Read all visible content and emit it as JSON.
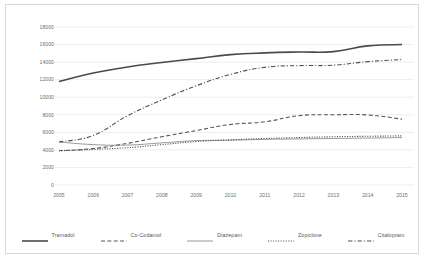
{
  "chart_data": {
    "type": "line",
    "title": "",
    "subtitle": "",
    "xlabel": "",
    "ylabel": "",
    "grid": true,
    "grid_axis": "y",
    "legend_position": "bottom",
    "x": [
      2005,
      2006,
      2007,
      2008,
      2009,
      2010,
      2011,
      2012,
      2013,
      2014,
      2015
    ],
    "categories": [
      "2005",
      "2006",
      "2007",
      "2008",
      "2009",
      "2010",
      "2011",
      "2012",
      "2013",
      "2014",
      "2015"
    ],
    "xlim": [
      2005,
      2015
    ],
    "ylim": [
      0,
      18000
    ],
    "yticks": [
      0,
      2000,
      4000,
      6000,
      8000,
      10000,
      12000,
      14000,
      16000,
      18000
    ],
    "ytick_labels": [
      "0",
      "2000",
      "4000",
      "6000",
      "8000",
      "10000",
      "12000",
      "14000",
      "16000",
      "18000"
    ],
    "xtick_labels": [
      "2005",
      "2006",
      "2007",
      "2008",
      "2009",
      "2010",
      "2011",
      "2012",
      "2013",
      "2014",
      "2015"
    ],
    "series": [
      {
        "name": "Tramadol",
        "style": "solid",
        "width": 1.6,
        "color": "#4a4a4a",
        "values": [
          11800,
          12750,
          13450,
          13950,
          14400,
          14850,
          15050,
          15150,
          15200,
          15850,
          16000
        ]
      },
      {
        "name": "Co-Codamol",
        "style": "dashed",
        "width": 1.1,
        "color": "#555555",
        "values": [
          3900,
          4150,
          4750,
          5500,
          6200,
          6900,
          7200,
          7900,
          8000,
          7980,
          7500
        ]
      },
      {
        "name": "Diazepam",
        "style": "solid",
        "width": 0.9,
        "color": "#8c8c8c",
        "values": [
          4900,
          4600,
          4550,
          4800,
          5050,
          5100,
          5200,
          5250,
          5300,
          5350,
          5400
        ]
      },
      {
        "name": "Zopiclone",
        "style": "dotted",
        "width": 1.1,
        "color": "#4f4f4f",
        "values": [
          3900,
          4050,
          4250,
          4600,
          4950,
          5150,
          5300,
          5400,
          5500,
          5550,
          5600
        ]
      },
      {
        "name": "Citalopram",
        "style": "dashdot",
        "width": 1.1,
        "color": "#4f4f4f",
        "values": [
          4900,
          5650,
          7900,
          9700,
          11300,
          12600,
          13400,
          13600,
          13650,
          14050,
          14300
        ]
      }
    ]
  },
  "legend": {
    "items": [
      {
        "label": "Tramadol",
        "style": "solid",
        "width": 1.6,
        "color": "#4a4a4a"
      },
      {
        "label": "Co-Codamol",
        "style": "dashed",
        "width": 1.1,
        "color": "#555555"
      },
      {
        "label": "Diazepam",
        "style": "solid",
        "width": 0.9,
        "color": "#8c8c8c"
      },
      {
        "label": "Zopiclone",
        "style": "dotted",
        "width": 1.1,
        "color": "#4f4f4f"
      },
      {
        "label": "Citalopram",
        "style": "dashdot",
        "width": 1.1,
        "color": "#4f4f4f"
      }
    ]
  },
  "colors": {
    "background": "#ffffff",
    "frame": "#d9d9d9",
    "gridline": "#e6e6e6",
    "tick_text": "#6e6e6e",
    "legend_text": "#595959"
  }
}
